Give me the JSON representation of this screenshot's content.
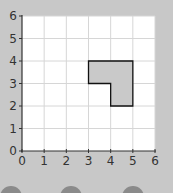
{
  "chart_data": {
    "type": "scatter",
    "title": "",
    "xlabel": "",
    "ylabel": "",
    "xlim": [
      0,
      6
    ],
    "ylim": [
      0,
      6
    ],
    "x_ticks": [
      "0",
      "1",
      "2",
      "3",
      "4",
      "5",
      "6"
    ],
    "y_ticks": [
      "0",
      "1",
      "2",
      "3",
      "4",
      "5",
      "6"
    ],
    "grid": true,
    "legend": null,
    "shapes": [
      {
        "name": "L-shape polygon",
        "fill": "#c9c9c9",
        "stroke": "#111111",
        "vertices": [
          [
            3,
            4
          ],
          [
            5,
            4
          ],
          [
            5,
            2
          ],
          [
            4,
            2
          ],
          [
            4,
            3
          ],
          [
            3,
            3
          ]
        ]
      }
    ]
  },
  "colors": {
    "background": "#c8c8c8",
    "plot_area": "#ffffff",
    "grid": "#d6d6d6",
    "axis": "#333333",
    "shape_fill": "#c9c9c9",
    "shape_stroke": "#111111",
    "dots": "#8a8a8a"
  },
  "bottom_dots": [
    {
      "label": ""
    },
    {
      "label": ""
    },
    {
      "label": ""
    }
  ]
}
